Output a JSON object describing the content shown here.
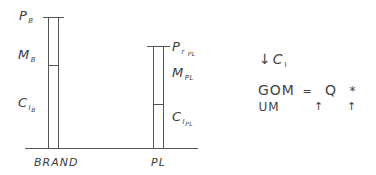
{
  "diagram": {
    "type": "bar-decomposition",
    "baseline": {
      "x1": 25,
      "x2": 198,
      "y": 148
    },
    "bars": [
      {
        "category": "BRAND",
        "top_label": {
          "main": "P",
          "sub": "B"
        },
        "upper_segment_label": {
          "main": "M",
          "sub": "B"
        },
        "lower_segment_label": {
          "main": "C",
          "sub": "I",
          "sub2": "B"
        }
      },
      {
        "category": "PL",
        "top_label": {
          "main": "P",
          "sub": "r",
          "sub2": "PL"
        },
        "upper_segment_label": {
          "main": "M",
          "sub": "PL"
        },
        "lower_segment_label": {
          "main": "C",
          "sub": "I",
          "sub2": "PL"
        }
      }
    ],
    "notes": {
      "ci_decrease": {
        "arrow": "↓",
        "main": "C",
        "sub": "I"
      },
      "equation": {
        "lhs": "GOM",
        "equals": "=",
        "term1": "Q",
        "operator": "*",
        "term2": "UM",
        "term1_arrow": "↑",
        "term2_arrow": "↑"
      }
    }
  }
}
